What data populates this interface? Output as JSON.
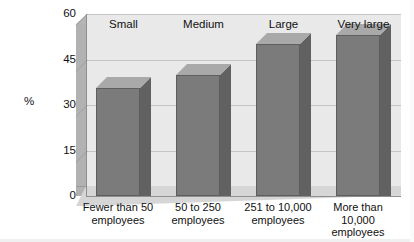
{
  "chart_data": {
    "type": "bar",
    "title": "",
    "xlabel": "",
    "ylabel": "%",
    "ylim": [
      0,
      60
    ],
    "yticks": [
      0,
      15,
      30,
      45,
      60
    ],
    "ytick_labels": [
      "0",
      "15",
      "30",
      "45",
      "60"
    ],
    "grid": true,
    "legend": "none",
    "style": "3d-bar",
    "categories": [
      "Fewer than 50 employees",
      "50 to 250 employees",
      "251 to 10,000 employees",
      "More than 10,000 employees"
    ],
    "category_top_labels": [
      "Small",
      "Medium",
      "Large",
      "Very large"
    ],
    "values": [
      35.6,
      40,
      50,
      53
    ],
    "series": [
      {
        "name": "%",
        "values": [
          35.6,
          40,
          50,
          53
        ]
      }
    ]
  },
  "axes": {
    "y_axis_title": "%",
    "ticks": [
      {
        "label": "60",
        "value": 60
      },
      {
        "label": "45",
        "value": 45
      },
      {
        "label": "30",
        "value": 30
      },
      {
        "label": "15",
        "value": 15
      },
      {
        "label": "0",
        "value": 0
      }
    ]
  },
  "groups": [
    {
      "top_label": "Small",
      "bottom_line1": "Fewer than 50",
      "bottom_line2": "employees",
      "bottom_line3": "",
      "value": 35.6
    },
    {
      "top_label": "Medium",
      "bottom_line1": "50 to 250",
      "bottom_line2": "employees",
      "bottom_line3": "",
      "value": 40
    },
    {
      "top_label": "Large",
      "bottom_line1": "251 to 10,000",
      "bottom_line2": "employees",
      "bottom_line3": "",
      "value": 50
    },
    {
      "top_label": "Very large",
      "bottom_line1": "More than",
      "bottom_line2": "10,000",
      "bottom_line3": "employees",
      "value": 53
    }
  ],
  "colors": {
    "bar_front": "#7b7b7b",
    "bar_side": "#616161",
    "bar_top": "#a9a9a9",
    "plot_background": "#e9e9e9",
    "left_wall": "#b2b2b2",
    "floor": "#d6d6d6",
    "gridline": "#c4c4c4",
    "axis": "#8f8f8f",
    "text": "#111111",
    "page_background": "#ffffff"
  }
}
